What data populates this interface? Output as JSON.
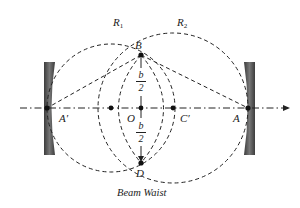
{
  "labels": {
    "R1": "R",
    "R1_sub": "1",
    "R2": "R",
    "R2_sub": "2",
    "B": "B",
    "D": "D",
    "O": "O",
    "A": "A",
    "A_prime": "A′",
    "C_prime": "C′",
    "b_top": "b",
    "two_top": "2",
    "b_bottom": "b",
    "two_bottom": "2"
  },
  "caption": "Beam Waist",
  "colors": {
    "line": "#222222",
    "mirror_dark": "#4a4a4a",
    "mirror_light": "#9a9a9a"
  }
}
